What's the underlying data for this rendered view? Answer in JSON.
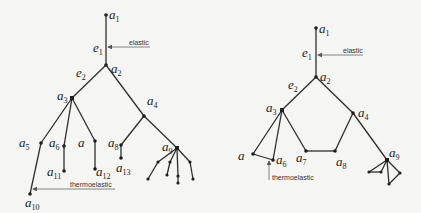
{
  "left_tree": {
    "nodes": {
      "a1": {
        "base": "a",
        "sub": "1"
      },
      "a2": {
        "base": "a",
        "sub": "2"
      },
      "a3": {
        "base": "a",
        "sub": "3"
      },
      "a4": {
        "base": "a",
        "sub": "4"
      },
      "a5": {
        "base": "a",
        "sub": "5"
      },
      "a6": {
        "base": "a",
        "sub": "6"
      },
      "a7": {
        "base": "a",
        "sub": ""
      },
      "a8": {
        "base": "a",
        "sub": "8"
      },
      "a9": {
        "base": "a",
        "sub": "9"
      },
      "a10": {
        "base": "a",
        "sub": "10"
      },
      "a11": {
        "base": "a",
        "sub": "11"
      },
      "a12": {
        "base": "a",
        "sub": "12"
      },
      "a13": {
        "base": "a",
        "sub": "13"
      }
    },
    "edges": {
      "e1": {
        "base": "e",
        "sub": "1"
      },
      "e2": {
        "base": "e",
        "sub": "2"
      }
    },
    "annotations": {
      "elastic": "elastic",
      "thermoelastic": "thermoelastic"
    }
  },
  "right_tree": {
    "nodes": {
      "a1": {
        "base": "a",
        "sub": "1"
      },
      "a2": {
        "base": "a",
        "sub": "2"
      },
      "a3": {
        "base": "a",
        "sub": "3"
      },
      "a4": {
        "base": "a",
        "sub": "4"
      },
      "a5": {
        "base": "a",
        "sub": ""
      },
      "a6": {
        "base": "a",
        "sub": "6"
      },
      "a7": {
        "base": "a",
        "sub": "7"
      },
      "a8": {
        "base": "a",
        "sub": "8"
      },
      "a9": {
        "base": "a",
        "sub": "9"
      }
    },
    "edges": {
      "e1": {
        "base": "e",
        "sub": "1"
      },
      "e2": {
        "base": "e",
        "sub": "2"
      }
    },
    "annotations": {
      "elastic": "elastic",
      "thermoelastic": "thermoelastic"
    }
  }
}
